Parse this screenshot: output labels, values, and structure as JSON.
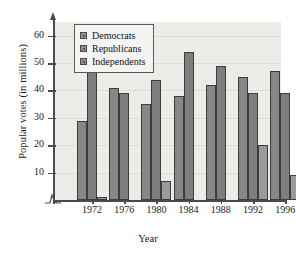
{
  "chart_data": {
    "type": "bar",
    "title": "",
    "xlabel": "Year",
    "ylabel": "Popular votes (in millions)",
    "categories": [
      "1972",
      "1976",
      "1980",
      "1984",
      "1988",
      "1992",
      "1996"
    ],
    "series": [
      {
        "name": "Democrats",
        "values": [
          29,
          41,
          35,
          38,
          42,
          45,
          47
        ]
      },
      {
        "name": "Republicans",
        "values": [
          47,
          39,
          44,
          54,
          49,
          39,
          39
        ]
      },
      {
        "name": "Independents",
        "values": [
          1,
          0,
          7,
          0,
          0,
          20,
          9
        ]
      }
    ],
    "yticks": [
      10,
      20,
      30,
      40,
      50,
      60
    ],
    "ylim": [
      0,
      65
    ],
    "grid": true,
    "legend_position": "top-left",
    "axis_break": true
  },
  "legend": {
    "items": [
      {
        "label": "Democrats"
      },
      {
        "label": "Republicans"
      },
      {
        "label": "Independents"
      }
    ]
  },
  "colors": {
    "democrat": "#878787",
    "republican": "#7e7e7e",
    "independent": "#9a9a9a",
    "plot_background": "#ecece9",
    "axis": "#4a4a4a",
    "gridline": "#dcdcd8"
  }
}
